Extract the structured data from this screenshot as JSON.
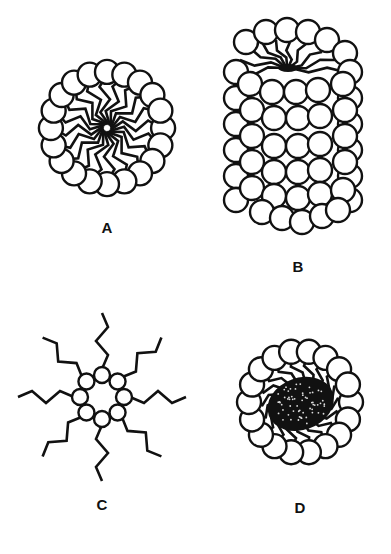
{
  "figure": {
    "panels": [
      {
        "id": "A",
        "label": "A",
        "description": "spherical micelle: ring of polar heads with zig-zag tails pointing to center",
        "center": [
          107,
          128
        ],
        "head_count": 20,
        "head_radius": 12,
        "ring_radius": 66,
        "label_pos": [
          107,
          227
        ]
      },
      {
        "id": "B",
        "label": "B",
        "description": "elongated/vesicle-like aggregate: many packed heads with tails converging at the top",
        "center": [
          290,
          135
        ],
        "label_pos": [
          298,
          266
        ]
      },
      {
        "id": "C",
        "label": "C",
        "description": "reverse micelle: small ring of heads with zig-zag tails pointing outward",
        "center": [
          102,
          397
        ],
        "head_count": 8,
        "head_radius": 8,
        "ring_radius": 22,
        "label_pos": [
          102,
          504
        ]
      },
      {
        "id": "D",
        "label": "D",
        "description": "micelle with solubilized hydrophobic core (dense stippled center)",
        "center": [
          300,
          402
        ],
        "head_count": 18,
        "head_radius": 12,
        "ring_radius": 60,
        "label_pos": [
          300,
          507
        ]
      }
    ],
    "colors": {
      "stroke": "#111111",
      "background": "#ffffff",
      "head_fill": "#ffffff"
    }
  }
}
